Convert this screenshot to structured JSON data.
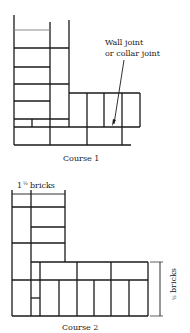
{
  "figure": {
    "course1": {
      "caption": "Course 1",
      "annotation_line1": "Wall joint",
      "annotation_line2": "or collar joint"
    },
    "course2": {
      "caption": "Course 2",
      "width_dimension": "1½ bricks",
      "width_whole": "1",
      "width_frac": "½",
      "width_unit": "bricks",
      "depth_dimension": "½ bricks",
      "depth_frac": "½",
      "depth_unit": "bricks"
    }
  }
}
